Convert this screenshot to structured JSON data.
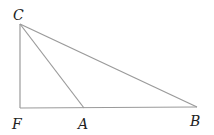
{
  "diagram": {
    "points": {
      "C": {
        "label": "C",
        "x": 20,
        "y": 24,
        "lx": 13,
        "ly": 20
      },
      "F": {
        "label": "F",
        "x": 20,
        "y": 108,
        "lx": 12,
        "ly": 129
      },
      "A": {
        "label": "A",
        "x": 84,
        "y": 108,
        "lx": 78,
        "ly": 129
      },
      "B": {
        "label": "B",
        "x": 197,
        "y": 107,
        "lx": 190,
        "ly": 126
      }
    },
    "segments": [
      [
        "C",
        "F"
      ],
      [
        "F",
        "B"
      ],
      [
        "C",
        "A"
      ],
      [
        "C",
        "B"
      ]
    ]
  }
}
